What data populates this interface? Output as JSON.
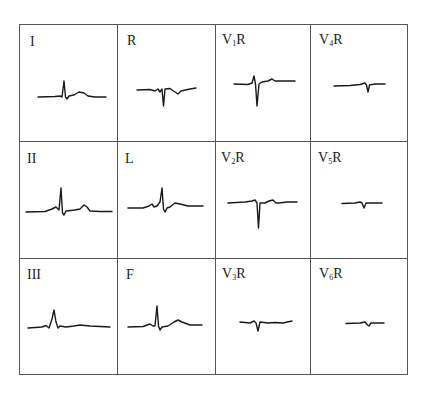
{
  "figure": {
    "type": "ECG lead grid",
    "rows": 3,
    "columns": 4,
    "leads": [
      {
        "id": "I",
        "label": "I",
        "sub": "",
        "suffix": ""
      },
      {
        "id": "R",
        "label": "R",
        "sub": "",
        "suffix": ""
      },
      {
        "id": "V1R",
        "label": "V",
        "sub": "1",
        "suffix": "R"
      },
      {
        "id": "V4R",
        "label": "V",
        "sub": "4",
        "suffix": "R"
      },
      {
        "id": "II",
        "label": "II",
        "sub": "",
        "suffix": ""
      },
      {
        "id": "L",
        "label": "L",
        "sub": "",
        "suffix": ""
      },
      {
        "id": "V2R",
        "label": "V",
        "sub": "2",
        "suffix": "R"
      },
      {
        "id": "V5R",
        "label": "V",
        "sub": "5",
        "suffix": "R"
      },
      {
        "id": "III",
        "label": "III",
        "sub": "",
        "suffix": ""
      },
      {
        "id": "F",
        "label": "F",
        "sub": "",
        "suffix": ""
      },
      {
        "id": "V3R",
        "label": "V",
        "sub": "3",
        "suffix": "R"
      },
      {
        "id": "V6R",
        "label": "V",
        "sub": "6",
        "suffix": "R"
      }
    ],
    "colors": {
      "line": "#555555",
      "trace": "#1a1a1a",
      "background": "#ffffff"
    }
  }
}
